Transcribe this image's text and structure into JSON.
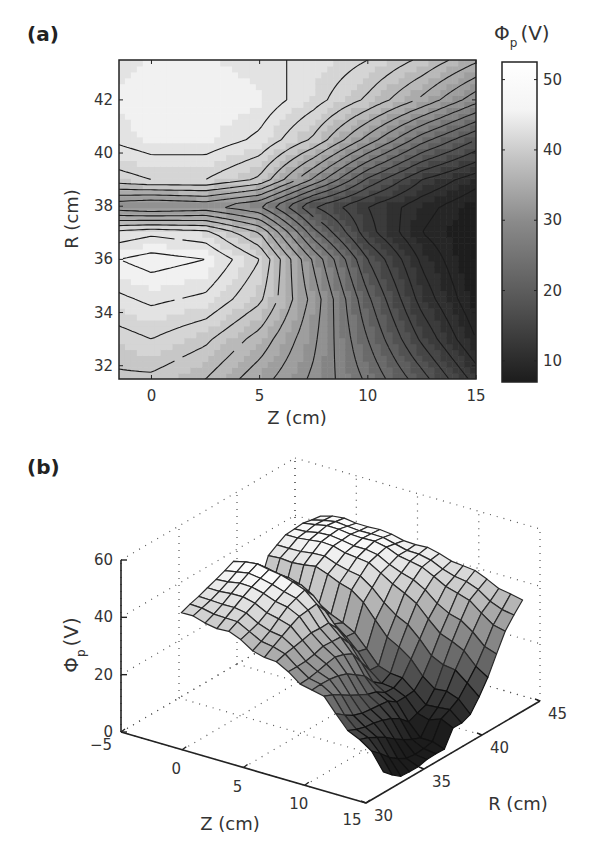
{
  "panels": {
    "a": {
      "label": "(a)"
    },
    "b": {
      "label": "(b)"
    }
  },
  "chart_data": [
    {
      "type": "heatmap",
      "panel": "(a)",
      "subtype": "filled contour with contour lines (grayscale)",
      "xlabel": "Z (cm)",
      "ylabel": "R (cm)",
      "colorbar_label": "Φp (V)",
      "colorbar_label_main": "Φ",
      "colorbar_label_sub": "p",
      "colorbar_label_unit": "(V)",
      "xlim": [
        -1.5,
        15
      ],
      "ylim": [
        31.5,
        43.5
      ],
      "xticks": [
        "0",
        "5",
        "10",
        "15"
      ],
      "xtick_values": [
        0,
        5,
        10,
        15
      ],
      "yticks": [
        "32",
        "34",
        "36",
        "38",
        "40",
        "42"
      ],
      "ytick_values": [
        32,
        34,
        36,
        38,
        40,
        42
      ],
      "colorbar_ticks": [
        "10",
        "20",
        "30",
        "40",
        "50"
      ],
      "colorbar_tick_values": [
        10,
        20,
        30,
        40,
        50
      ],
      "colorbar_range": [
        7,
        52.5
      ],
      "colormap": "gray",
      "x": [
        -1.5,
        0,
        2.5,
        5,
        7.5,
        10,
        12.5,
        15
      ],
      "y": [
        31.5,
        33,
        34.5,
        36,
        37,
        38,
        39,
        40.5,
        42,
        43.5
      ],
      "z": [
        [
          42,
          42,
          40,
          36,
          32,
          27,
          21,
          14
        ],
        [
          44,
          45,
          43,
          39,
          33,
          25,
          17,
          10
        ],
        [
          47,
          48,
          47,
          43,
          34,
          23,
          14,
          8
        ],
        [
          50,
          51,
          50,
          45,
          32,
          20,
          12,
          7
        ],
        [
          46,
          47,
          46,
          40,
          26,
          16,
          10,
          7
        ],
        [
          33,
          32,
          33,
          30,
          20,
          15,
          11,
          8
        ],
        [
          44,
          45,
          45,
          42,
          32,
          22,
          15,
          11
        ],
        [
          48,
          49,
          49,
          47,
          42,
          34,
          26,
          20
        ],
        [
          49,
          50,
          50,
          49,
          46,
          42,
          37,
          31
        ],
        [
          48,
          49,
          49,
          48,
          47,
          45,
          42,
          38
        ]
      ]
    },
    {
      "type": "surface",
      "panel": "(b)",
      "subtype": "3D mesh surface",
      "xlabel": "Z (cm)",
      "ylabel": "R (cm)",
      "zlabel": "Φp (V)",
      "zlabel_main": "Φ",
      "zlabel_sub": "p",
      "zlabel_unit": "(V)",
      "xlim": [
        -5,
        15
      ],
      "ylim": [
        30,
        45
      ],
      "zlim": [
        0,
        60
      ],
      "xticks": [
        "−5",
        "0",
        "5",
        "10",
        "15"
      ],
      "xtick_values": [
        -5,
        0,
        5,
        10,
        15
      ],
      "yticks": [
        "30",
        "35",
        "40",
        "45"
      ],
      "ytick_values": [
        30,
        35,
        40,
        45
      ],
      "zticks": [
        "0",
        "20",
        "40",
        "60"
      ],
      "ztick_values": [
        0,
        20,
        40,
        60
      ],
      "grid": "dotted",
      "note": "Same potential data as panel (a) rendered as a shaded mesh"
    }
  ]
}
